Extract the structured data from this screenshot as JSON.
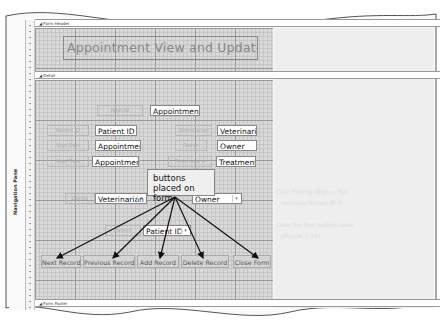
{
  "sections": {
    "form_header": "Form Header",
    "detail": "Detail",
    "form_footer": "Form Footer"
  },
  "navigation_pane": {
    "label": "Navigation Pane"
  },
  "form_title": "Appointment View and Update Form",
  "fields": {
    "appt_id": {
      "label": "Appt ID",
      "value": "Appointmen"
    },
    "patient_id": {
      "label": "Patient ID",
      "value": "Patient ID"
    },
    "appt_date": {
      "label": "Appt Date",
      "value": "Appointment"
    },
    "appt_time": {
      "label": "Appt Time",
      "value": "Appointment"
    },
    "veterinarian": {
      "label": "Veterinarian",
      "value": "Veterinaria"
    },
    "owner": {
      "label": "Owner",
      "value": "Owner"
    },
    "treatment": {
      "label": "Treatment #",
      "value": "Treatment t"
    }
  },
  "combos": {
    "doctor": {
      "label": "Doctor",
      "value": "Veterinarian"
    },
    "owner": {
      "value": "Owner"
    },
    "patient": {
      "label": "Patient",
      "value": "Patient ID"
    }
  },
  "buttons": [
    {
      "label": "Next Record"
    },
    {
      "label": "Previous Record"
    },
    {
      "label": "Add Record"
    },
    {
      "label": "Delete Record"
    },
    {
      "label": "Close Form"
    }
  ],
  "callout": {
    "text": "buttons placed on form"
  },
  "background_bleed": [
    "Click First to display the",
    "contains Brown M-H",
    "Click the first button label",
    "(Figure 7-24)"
  ],
  "ruler_marks": [
    "1",
    "2",
    "3",
    "4",
    "5"
  ]
}
